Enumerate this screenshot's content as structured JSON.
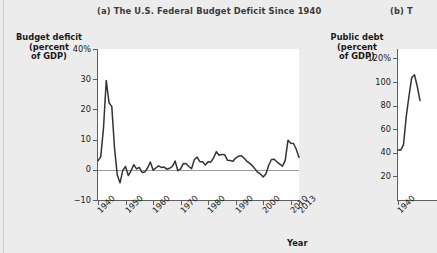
{
  "page": {
    "background_color": "#ececec",
    "plot_background_color": "#ffffff",
    "line_color": "#333333",
    "axis_color": "#5f5f5f"
  },
  "panel_a": {
    "title": "(a) The U.S. Federal Budget Deficit Since 1940",
    "ytitle": "Budget deficit\n(percent\nof GDP)",
    "xtitle": "Year"
  },
  "panel_b": {
    "title": "(b) T",
    "ytitle": "Public debt\n(percent\nof GDP)"
  },
  "chart_data": [
    {
      "type": "line",
      "id": "budget-deficit",
      "title": "(a) The U.S. Federal Budget Deficit Since 1940",
      "xlabel": "Year",
      "ylabel": "Budget deficit (percent of GDP)",
      "xlim": [
        1940,
        2013
      ],
      "ylim": [
        -10,
        40
      ],
      "yticks": [
        -10,
        0,
        10,
        20,
        30,
        40
      ],
      "ytick_labels": [
        "−10",
        "0",
        "10",
        "20",
        "30",
        "40%"
      ],
      "xticks": [
        1940,
        1950,
        1960,
        1970,
        1980,
        1990,
        2000,
        2010,
        2013
      ],
      "xtick_labels": [
        "1940",
        "1950",
        "1960",
        "1970",
        "1980",
        "1990",
        "2000",
        "2010",
        "2013"
      ],
      "grid": false,
      "legend": "none",
      "zero_reference_line": true,
      "x": [
        1940,
        1941,
        1942,
        1943,
        1944,
        1945,
        1946,
        1947,
        1948,
        1949,
        1950,
        1951,
        1952,
        1953,
        1954,
        1955,
        1956,
        1957,
        1958,
        1959,
        1960,
        1961,
        1962,
        1963,
        1964,
        1965,
        1966,
        1967,
        1968,
        1969,
        1970,
        1971,
        1972,
        1973,
        1974,
        1975,
        1976,
        1977,
        1978,
        1979,
        1980,
        1981,
        1982,
        1983,
        1984,
        1985,
        1986,
        1987,
        1988,
        1989,
        1990,
        1991,
        1992,
        1993,
        1994,
        1995,
        1996,
        1997,
        1998,
        1999,
        2000,
        2001,
        2002,
        2003,
        2004,
        2005,
        2006,
        2007,
        2008,
        2009,
        2010,
        2011,
        2012,
        2013
      ],
      "values": [
        3.0,
        4.3,
        13.9,
        29.6,
        22.2,
        21.0,
        7.2,
        -1.7,
        -4.3,
        -0.2,
        1.1,
        -1.9,
        -0.3,
        1.7,
        0.3,
        0.8,
        -0.9,
        -0.7,
        0.6,
        2.6,
        -0.1,
        0.6,
        1.3,
        0.8,
        0.9,
        0.2,
        0.5,
        1.1,
        2.9,
        -0.3,
        0.3,
        2.1,
        2.0,
        1.1,
        0.4,
        3.4,
        4.2,
        2.7,
        2.7,
        1.6,
        2.7,
        2.6,
        4.0,
        6.0,
        4.8,
        5.1,
        5.0,
        3.2,
        3.1,
        2.8,
        3.9,
        4.5,
        4.7,
        3.9,
        2.9,
        2.2,
        1.4,
        0.3,
        -0.8,
        -1.4,
        -2.4,
        -1.3,
        1.5,
        3.4,
        3.5,
        2.6,
        1.9,
        1.2,
        3.1,
        9.8,
        8.8,
        8.7,
        6.8,
        4.1
      ],
      "series_name": "Federal budget deficit (percent of GDP)"
    },
    {
      "type": "line",
      "id": "public-debt",
      "title": "(b) T",
      "ylabel": "Public debt (percent of GDP)",
      "ylim": [
        0,
        128
      ],
      "yticks": [
        20,
        40,
        60,
        80,
        100,
        120
      ],
      "ytick_labels": [
        "20",
        "40",
        "60",
        "80",
        "100",
        "120%"
      ],
      "xticks": [
        1940
      ],
      "xtick_labels": [
        "1940"
      ],
      "grid": false,
      "legend": "none",
      "note": "Panel cropped at right edge of screenshot; only 1940 through approx. 1948 visible",
      "x": [
        1940,
        1941,
        1942,
        1943,
        1944,
        1945,
        1946,
        1947,
        1948
      ],
      "values": [
        42.4,
        42.3,
        47.0,
        70.9,
        88.3,
        103.9,
        106.1,
        96.2,
        84.3
      ],
      "series_name": "Public debt (percent of GDP)"
    }
  ]
}
